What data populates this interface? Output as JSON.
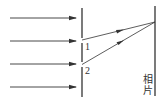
{
  "diagram": {
    "slit_labels": [
      "1",
      "2"
    ],
    "screen_label": "相片",
    "screen_label_chars": [
      "相",
      "片"
    ],
    "incident_ray_count": 4,
    "line_color": "#333333"
  }
}
